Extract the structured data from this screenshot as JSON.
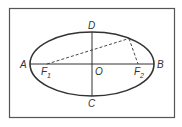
{
  "diagram": {
    "type": "ellipse-geometry",
    "colors": {
      "stroke": "#333333",
      "background": "#ffffff"
    },
    "frame": {
      "x": 9.5,
      "y": 8.5,
      "width": 165,
      "height": 109
    },
    "ellipse": {
      "cx": 92,
      "cy": 64,
      "rx": 62,
      "ry": 32
    },
    "points": {
      "A": {
        "label": "A",
        "x": 30,
        "y": 64
      },
      "B": {
        "label": "B",
        "x": 154,
        "y": 64
      },
      "C": {
        "label": "C",
        "x": 92,
        "y": 96
      },
      "D": {
        "label": "D",
        "x": 92,
        "y": 32
      },
      "O": {
        "label": "O",
        "x": 92,
        "y": 64
      },
      "F1": {
        "label": "F",
        "sub": "1",
        "x": 47,
        "y": 64
      },
      "F2": {
        "label": "F",
        "sub": "2",
        "x": 138,
        "y": 64
      },
      "P": {
        "x": 129,
        "y": 38
      }
    },
    "labels": {
      "A": "A",
      "B": "B",
      "C": "C",
      "D": "D",
      "O": "O",
      "F1_main": "F",
      "F1_sub": "1",
      "F2_main": "F",
      "F2_sub": "2"
    }
  }
}
